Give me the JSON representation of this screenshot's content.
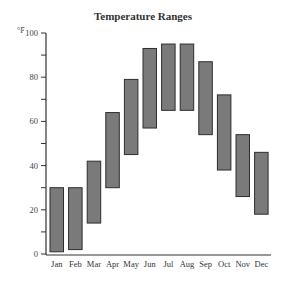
{
  "chart_data": {
    "type": "bar",
    "subtype": "floating-range",
    "title": "Temperature Ranges",
    "xlabel": "",
    "ylabel": "°F",
    "ylim": [
      0,
      100
    ],
    "yticks_major": [
      0,
      20,
      40,
      60,
      80,
      100
    ],
    "yticks_minor_step": 10,
    "grid": false,
    "legend": null,
    "categories": [
      "Jan",
      "Feb",
      "Mar",
      "Apr",
      "May",
      "Jun",
      "Jul",
      "Aug",
      "Sep",
      "Oct",
      "Nov",
      "Dec"
    ],
    "series": [
      {
        "name": "Low",
        "values": [
          1,
          2,
          14,
          30,
          45,
          57,
          65,
          65,
          54,
          38,
          26,
          18
        ]
      },
      {
        "name": "High",
        "values": [
          30,
          30,
          42,
          64,
          79,
          93,
          95,
          95,
          87,
          72,
          54,
          46
        ]
      }
    ],
    "colors": {
      "bar_fill": "#7a7a7a",
      "bar_stroke": "#2e2e2e",
      "axis": "#333333"
    }
  },
  "title": "Temperature Ranges",
  "unit_label": "°F"
}
